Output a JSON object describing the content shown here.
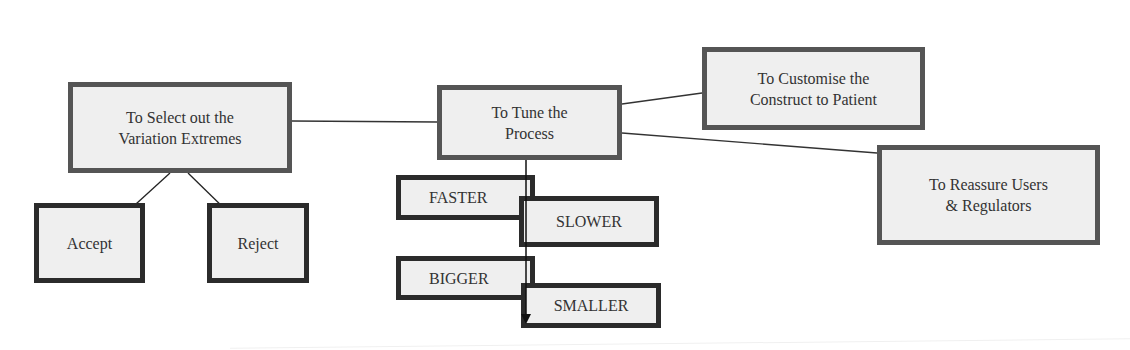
{
  "diagram": {
    "center": {
      "line1": "To Tune the",
      "line2": "Process"
    },
    "left": {
      "line1": "To Select out the",
      "line2": "Variation Extremes"
    },
    "top_right": {
      "line1": "To Customise the",
      "line2": "Construct to Patient"
    },
    "right": {
      "line1": "To Reassure Users",
      "line2": "& Regulators"
    },
    "left_children": [
      {
        "label": "Accept"
      },
      {
        "label": "Reject"
      }
    ],
    "tune_options": [
      {
        "label": "FASTER"
      },
      {
        "label": "SLOWER"
      },
      {
        "label": "BIGGER"
      },
      {
        "label": "SMALLER"
      }
    ],
    "colors": {
      "box_fill": "#efefef",
      "box_border_gray": "#555555",
      "box_border_dark": "#2b2b2b",
      "line": "#333333",
      "text": "#333333"
    }
  }
}
